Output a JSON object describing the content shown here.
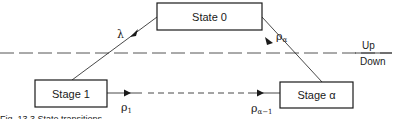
{
  "diagram": {
    "nodes": [
      {
        "id": "state0",
        "label": "State 0"
      },
      {
        "id": "stage1",
        "label": "Stage 1"
      },
      {
        "id": "stagea",
        "label": "Stage α"
      }
    ],
    "edges": [
      {
        "from": "state0",
        "to": "stage1",
        "rate": "λ",
        "rate_sub": "",
        "style": "solid"
      },
      {
        "from": "stagea",
        "to": "state0",
        "rate": "ρ",
        "rate_sub": "α",
        "style": "solid"
      },
      {
        "from": "stage1",
        "to": "stagea",
        "rate_start": "ρ",
        "rate_start_sub": "1",
        "rate_end": "ρ",
        "rate_end_sub": "α−1",
        "style": "dashed-middle"
      }
    ],
    "regions": {
      "up": "Up",
      "down": "Down"
    },
    "caption": "Fig. 13.3  State transitions"
  },
  "colors": {
    "line": "#1a1a1a",
    "dashed_divider": "#555555",
    "background": "#ffffff"
  }
}
